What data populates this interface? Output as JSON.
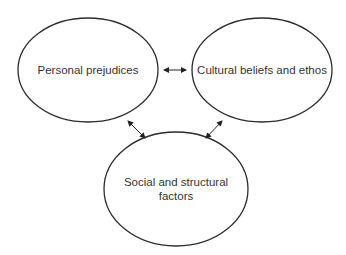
{
  "diagram": {
    "nodes": [
      {
        "id": "personal",
        "label": "Personal prejudices",
        "lines": [
          "Personal prejudices"
        ]
      },
      {
        "id": "cultural",
        "label": "Cultural beliefs and ethos",
        "lines": [
          "Cultural beliefs and ethos"
        ]
      },
      {
        "id": "social",
        "label": "Social and structural factors",
        "lines": [
          "Social and structural",
          "factors"
        ]
      }
    ],
    "edges": [
      {
        "from": "personal",
        "to": "cultural",
        "type": "bidirectional"
      },
      {
        "from": "personal",
        "to": "social",
        "type": "bidirectional"
      },
      {
        "from": "cultural",
        "to": "social",
        "type": "bidirectional"
      }
    ],
    "colors": {
      "stroke": "#2b2b2b",
      "text": "#333333",
      "background": "#ffffff"
    }
  }
}
